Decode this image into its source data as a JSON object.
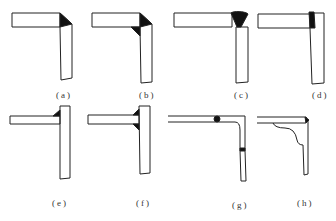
{
  "figure": {
    "panels": [
      {
        "id": "a",
        "label": "(a)",
        "joint": "corner",
        "weld": "outside-fillet"
      },
      {
        "id": "b",
        "label": "(b)",
        "joint": "corner",
        "weld": "outside-and-inside-fillet"
      },
      {
        "id": "c",
        "label": "(c)",
        "joint": "corner",
        "weld": "groove-butt"
      },
      {
        "id": "d",
        "label": "(d)",
        "joint": "corner",
        "weld": "end-groove"
      },
      {
        "id": "e",
        "label": "(e)",
        "joint": "T",
        "weld": "single-fillet"
      },
      {
        "id": "f",
        "label": "(f)",
        "joint": "T",
        "weld": "double-fillet"
      },
      {
        "id": "g",
        "label": "(g)",
        "joint": "bent-plate",
        "weld": "butt-welds"
      },
      {
        "id": "h",
        "label": "(h)",
        "joint": "bent-bracket",
        "weld": "corner-spot"
      }
    ],
    "colors": {
      "line": "#222222",
      "weld": "#111111",
      "background": "#ffffff"
    }
  }
}
